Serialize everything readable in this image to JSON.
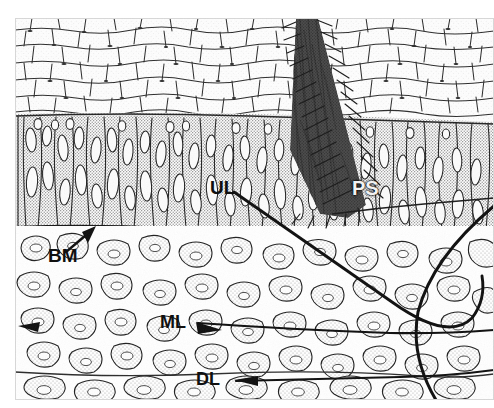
{
  "figure": {
    "type": "histology-illustration",
    "width": 494,
    "height": 408,
    "background_color": "#ffffff",
    "ink_color": "#1a1a1a",
    "stipple_color": "#8a8a8a",
    "dark_mass_color": "#141414"
  },
  "labels": [
    {
      "id": "UL",
      "text": "UL",
      "meaning": "upper line",
      "style": "dark",
      "x": 210,
      "y": 178,
      "font_size": 19,
      "leader": "diagonal line running down-right then curving into a J hook"
    },
    {
      "id": "PS",
      "text": "PS",
      "meaning": "pigmented structure",
      "style": "light",
      "x": 352,
      "y": 178,
      "font_size": 20,
      "leader": "none"
    },
    {
      "id": "BM",
      "text": "BM",
      "meaning": "basement membrane",
      "style": "dark",
      "x": 48,
      "y": 246,
      "font_size": 19,
      "leader": "short solid arrow pointing up and to the right"
    },
    {
      "id": "ML",
      "text": "ML",
      "meaning": "middle line",
      "style": "dark",
      "x": 160,
      "y": 313,
      "font_size": 18,
      "leader": "horizontal arrow pointing right, line continues to right edge"
    },
    {
      "id": "DL",
      "text": "DL",
      "meaning": "deep line",
      "style": "dark",
      "x": 196,
      "y": 370,
      "font_size": 18,
      "leader": "horizontal line with arrowhead pointing left"
    }
  ],
  "regions": [
    {
      "name": "superficial-squamous-layer",
      "top": 18,
      "bottom": 116,
      "fill": "#fdfdfd",
      "cell_style": "large pale polygonal cells with dark thin outlines"
    },
    {
      "name": "columnar-basal-layer",
      "top": 116,
      "bottom": 226,
      "fill": "#d2d2d2",
      "cell_style": "tall narrow vertically elongated stippled cells"
    },
    {
      "name": "basement-membrane-line",
      "top": 226,
      "bottom": 230,
      "fill": "#1a1a1a",
      "cell_style": "continuous dark boundary line"
    },
    {
      "name": "lamina-propria",
      "top": 230,
      "bottom": 400,
      "fill": "#fbfbfb",
      "cell_style": "irregular loosely packed stippled stellate cells"
    },
    {
      "name": "pigmented-wedge",
      "apex_x": 300,
      "apex_y": 20,
      "base_x": 360,
      "base_y": 215,
      "fill": "#141414",
      "cell_style": "dense black wedge descending from surface into epithelium"
    }
  ],
  "leader_lines": [
    {
      "name": "ul-leader",
      "from": [
        232,
        192
      ],
      "to": [
        476,
        352
      ],
      "kind": "curved-j"
    },
    {
      "name": "ps-boundary",
      "from": [
        330,
        215
      ],
      "to": [
        420,
        205
      ],
      "kind": "straight"
    },
    {
      "name": "bm-arrow",
      "from": [
        62,
        252
      ],
      "to": [
        96,
        228
      ],
      "kind": "arrow"
    },
    {
      "name": "ml-arrow",
      "from": [
        190,
        323
      ],
      "to": [
        494,
        331
      ],
      "kind": "arrow-left-head"
    },
    {
      "name": "dl-arrow",
      "from": [
        230,
        381
      ],
      "to": [
        494,
        372
      ],
      "kind": "arrow-left-head"
    },
    {
      "name": "right-curve",
      "from": [
        494,
        210
      ],
      "to": [
        440,
        400
      ],
      "kind": "curved-j"
    }
  ]
}
